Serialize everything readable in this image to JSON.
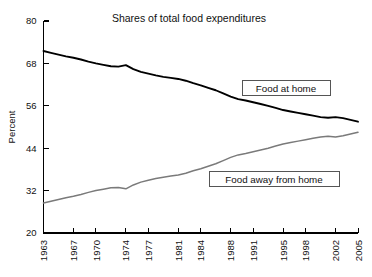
{
  "chart_data": {
    "type": "line",
    "title": "Shares of total food expenditures",
    "xlabel": "",
    "ylabel": "Percent",
    "ylim": [
      20,
      80
    ],
    "yticks": [
      20,
      32,
      44,
      56,
      68,
      80
    ],
    "xlim": [
      1963,
      2005
    ],
    "xticks": [
      1963,
      1967,
      1970,
      1974,
      1977,
      1981,
      1984,
      1988,
      1991,
      1995,
      1998,
      2002,
      2005
    ],
    "grid": false,
    "legend_position": "inline-boxed",
    "x": [
      1963,
      1964,
      1965,
      1966,
      1967,
      1968,
      1969,
      1970,
      1971,
      1972,
      1973,
      1974,
      1975,
      1976,
      1977,
      1978,
      1979,
      1980,
      1981,
      1982,
      1983,
      1984,
      1985,
      1986,
      1987,
      1988,
      1989,
      1990,
      1991,
      1992,
      1993,
      1994,
      1995,
      1996,
      1997,
      1998,
      1999,
      2000,
      2001,
      2002,
      2003,
      2004,
      2005
    ],
    "series": [
      {
        "name": "Food at home",
        "color": "#000000",
        "values": [
          71.5,
          71.0,
          70.5,
          70.0,
          69.6,
          69.1,
          68.5,
          68.0,
          67.6,
          67.2,
          67.1,
          67.5,
          66.4,
          65.6,
          65.1,
          64.6,
          64.2,
          63.9,
          63.6,
          63.1,
          62.4,
          61.8,
          61.1,
          60.4,
          59.5,
          58.6,
          57.9,
          57.5,
          57.0,
          56.5,
          56.0,
          55.4,
          54.8,
          54.4,
          54.0,
          53.6,
          53.2,
          52.8,
          52.6,
          52.8,
          52.5,
          52.0,
          51.5
        ]
      },
      {
        "name": "Food away from home",
        "color": "#7a7a7a",
        "values": [
          28.5,
          29.0,
          29.5,
          30.0,
          30.4,
          30.9,
          31.5,
          32.0,
          32.4,
          32.8,
          32.9,
          32.5,
          33.6,
          34.4,
          34.9,
          35.4,
          35.8,
          36.1,
          36.4,
          36.9,
          37.6,
          38.2,
          38.9,
          39.6,
          40.5,
          41.4,
          42.1,
          42.5,
          43.0,
          43.5,
          44.0,
          44.6,
          45.2,
          45.6,
          46.0,
          46.4,
          46.8,
          47.2,
          47.4,
          47.2,
          47.5,
          48.0,
          48.5
        ]
      }
    ],
    "legend_labels": [
      "Food at home",
      "Food away from home"
    ]
  }
}
